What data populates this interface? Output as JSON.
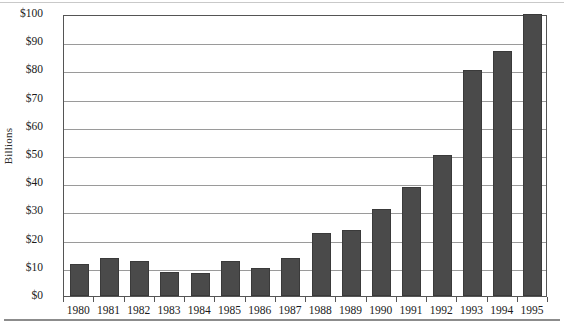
{
  "chart_data": {
    "type": "bar",
    "title": "",
    "subtitle": "",
    "xlabel": "",
    "ylabel": "Billions",
    "categories": [
      "1980",
      "1981",
      "1982",
      "1983",
      "1984",
      "1985",
      "1986",
      "1987",
      "1988",
      "1989",
      "1990",
      "1991",
      "1992",
      "1993",
      "1994",
      "1995"
    ],
    "values": [
      11.5,
      13.5,
      12.5,
      8.5,
      8,
      12.5,
      10,
      13.5,
      22.5,
      23.5,
      31,
      38.5,
      50,
      80,
      87,
      100
    ],
    "series": [
      {
        "name": "Billions",
        "values": [
          11.5,
          13.5,
          12.5,
          8.5,
          8,
          12.5,
          10,
          13.5,
          22.5,
          23.5,
          31,
          38.5,
          50,
          80,
          87,
          100
        ]
      }
    ],
    "ylim": [
      0,
      100
    ],
    "ytick_values": [
      0,
      10,
      20,
      30,
      40,
      50,
      60,
      70,
      80,
      90,
      100
    ],
    "ytick_labels": [
      "$0",
      "$10",
      "$20",
      "$30",
      "$40",
      "$50",
      "$60",
      "$70",
      "$80",
      "$90",
      "$100"
    ],
    "grid": true,
    "grid_axis": "y",
    "legend": false,
    "legend_position": "none",
    "bar_color": "#4a4a4a",
    "gridline_color": "#9a9a9a",
    "axis_color": "#555555",
    "background_color": "#ffffff"
  }
}
